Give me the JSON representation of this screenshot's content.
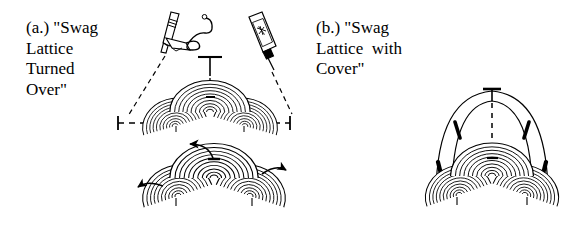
{
  "figure": {
    "kind": "two-panel-craft-diagram",
    "background_color": "#ffffff",
    "ink_color": "#000000",
    "panels": [
      {
        "id": "a",
        "label_lines": [
          "(a.) \"Swag",
          "Lattice",
          "Turned",
          "Over\""
        ],
        "label_text": "(a.) \"Swag Lattice Turned Over\"",
        "elements": [
          "glue-gun-icon",
          "glue-bottle-icon",
          "dashed-leader-lines",
          "center-t-marker",
          "width-dimension-line",
          "swag-lattice-dome-upper",
          "swag-lattice-dome-lower",
          "rotation-arrows"
        ],
        "arrow_count": 3
      },
      {
        "id": "b",
        "label_lines": [
          "(b.) \"Swag",
          "Lattice  with",
          "Cover\""
        ],
        "label_text": "(b.) \"Swag Lattice with Cover\"",
        "elements": [
          "cover-arc-outer",
          "cover-arc-inner",
          "center-t-marker",
          "vertical-dashed-centerline",
          "swag-lattice-dome-covered"
        ],
        "arrow_count": 0
      }
    ]
  }
}
